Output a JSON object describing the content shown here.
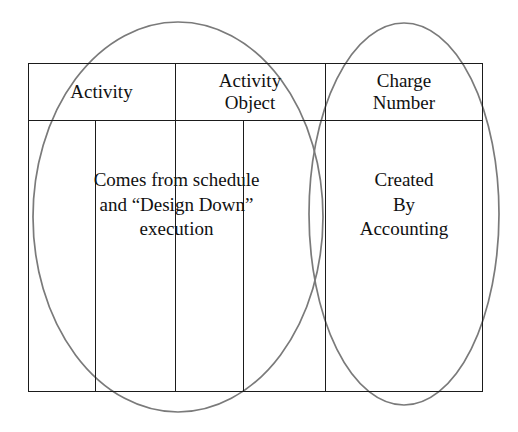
{
  "diagram": {
    "background_color": "#ffffff",
    "line_color": "#1b1b1b",
    "ellipse_color": "#7a7a7a"
  },
  "table": {
    "headers": [
      {
        "id": "activity",
        "label": "Activity"
      },
      {
        "id": "activity-object",
        "label": "Activity\nObject"
      },
      {
        "id": "charge-number",
        "label": "Charge\nNumber"
      }
    ],
    "body": [
      {
        "id": "schedule-source",
        "text": "Comes from schedule\nand “Design Down”\nexecution"
      },
      {
        "id": "accounting-source",
        "text": "Created\nBy\nAccounting"
      }
    ]
  },
  "ellipses": [
    {
      "id": "left-ellipse",
      "cx": 178,
      "cy": 217,
      "rx": 145,
      "ry": 195,
      "stroke": "#7a7a7a"
    },
    {
      "id": "right-ellipse",
      "cx": 404,
      "cy": 214,
      "rx": 95,
      "ry": 191,
      "stroke": "#7a7a7a"
    }
  ]
}
